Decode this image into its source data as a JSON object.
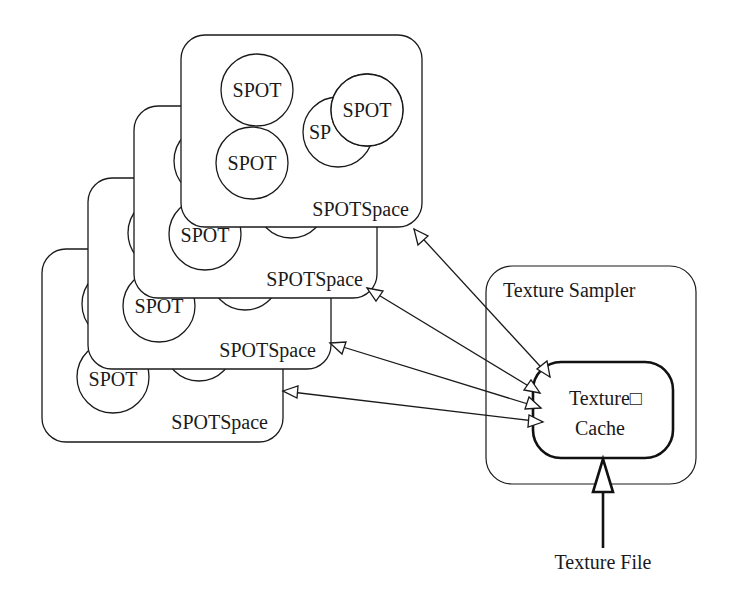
{
  "diagram": {
    "type": "architecture",
    "colors": {
      "stroke": "#1a1a1a",
      "background": "#ffffff"
    },
    "spot_spaces": [
      {
        "label": "SPOTSpace",
        "x": 42,
        "y": 249,
        "w": 241,
        "h": 193
      },
      {
        "label": "SPOTSpace",
        "x": 88,
        "y": 178,
        "w": 243,
        "h": 191
      },
      {
        "label": "SPOTSpace",
        "x": 134,
        "y": 106,
        "w": 243,
        "h": 192
      },
      {
        "label": "SPOTSpace",
        "x": 181,
        "y": 35,
        "w": 241,
        "h": 192
      }
    ],
    "spot_label": "SPOT",
    "spot_partial_label": "SP",
    "texture_sampler": {
      "label": "Texture Sampler"
    },
    "texture_cache": {
      "line1": "Texture□",
      "line2": "Cache"
    },
    "texture_file": {
      "label": "Texture File"
    },
    "connections": [
      {
        "from": "SPOTSpace 1",
        "to": "Texture Cache",
        "bidirectional": true
      },
      {
        "from": "SPOTSpace 2",
        "to": "Texture Cache",
        "bidirectional": true
      },
      {
        "from": "SPOTSpace 3",
        "to": "Texture Cache",
        "bidirectional": true
      },
      {
        "from": "SPOTSpace 4",
        "to": "Texture Cache",
        "bidirectional": true
      },
      {
        "from": "Texture File",
        "to": "Texture Cache",
        "bidirectional": false
      }
    ]
  }
}
